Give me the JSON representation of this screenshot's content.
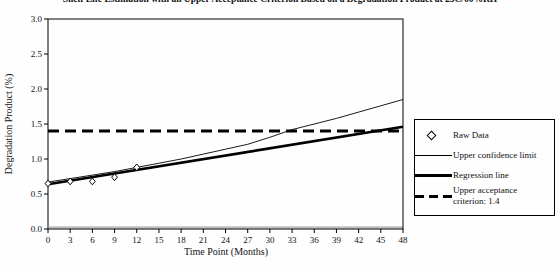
{
  "figure": {
    "title_clipped": "Shelf Life Estimation with an Upper Acceptance Criterion Based on a Degradation Product at 25C/60%RH"
  },
  "legend": {
    "items": [
      {
        "label": "Raw Data",
        "swatch": "open-diamond"
      },
      {
        "label": "Upper confidence limit",
        "swatch": "thin-line"
      },
      {
        "label": "Regression line",
        "swatch": "thick-line"
      },
      {
        "label": "Upper acceptance criterion: 1.4",
        "swatch": "thick-dashed-line"
      }
    ]
  },
  "chart_data": {
    "type": "line",
    "title": "Shelf Life Estimation with an Upper Acceptance Criterion Based on a Degradation Product at 25C/60%RH",
    "xlabel": "Time Point (Months)",
    "ylabel": "Degradation Product (%)",
    "xlim": [
      0,
      48
    ],
    "ylim": [
      0.0,
      3.0
    ],
    "x_ticks": [
      0,
      3,
      6,
      9,
      12,
      15,
      18,
      21,
      24,
      27,
      30,
      33,
      36,
      39,
      42,
      45,
      48
    ],
    "x_tick_labels": [
      "0",
      "3",
      "6",
      "9",
      "12",
      "15",
      "18",
      "21",
      "24",
      "27",
      "30",
      "33",
      "36",
      "39",
      "42",
      "45",
      "48"
    ],
    "y_ticks": [
      0.0,
      0.5,
      1.0,
      1.5,
      2.0,
      2.5,
      3.0
    ],
    "y_tick_labels": [
      "0.0",
      "0.5",
      "1.0",
      "1.5",
      "2.0",
      "2.5",
      "3.0"
    ],
    "grid": false,
    "legend_position": "right-outside",
    "series": [
      {
        "name": "Raw Data",
        "kind": "scatter",
        "marker": "open-diamond",
        "x": [
          0,
          3,
          6,
          9,
          12
        ],
        "y": [
          0.65,
          0.68,
          0.68,
          0.74,
          0.88
        ]
      },
      {
        "name": "Upper confidence limit",
        "kind": "line",
        "style": "thin-solid",
        "x": [
          0,
          3,
          6,
          9,
          12,
          15,
          18,
          21,
          24,
          27,
          30,
          33,
          36,
          39,
          42,
          45,
          48
        ],
        "y": [
          0.67,
          0.72,
          0.77,
          0.82,
          0.88,
          0.94,
          1.0,
          1.07,
          1.14,
          1.21,
          1.31,
          1.42,
          1.5,
          1.58,
          1.67,
          1.76,
          1.85
        ]
      },
      {
        "name": "Regression line",
        "kind": "line",
        "style": "thick-solid",
        "x": [
          0,
          48
        ],
        "y": [
          0.64,
          1.46
        ]
      },
      {
        "name": "Upper acceptance criterion: 1.4",
        "kind": "line",
        "style": "thick-dashed",
        "x": [
          0,
          48
        ],
        "y": [
          1.4,
          1.4
        ]
      }
    ],
    "annotations": {
      "acceptance_criterion_value": 1.4,
      "confidence_limit_crosses_criterion_at_months": 32
    }
  }
}
